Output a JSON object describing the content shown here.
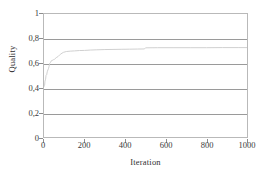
{
  "chart_data": {
    "type": "line",
    "title": "",
    "subtitle": "",
    "xlabel": "Iteration",
    "ylabel": "Quality",
    "xlim": [
      0,
      1000
    ],
    "ylim": [
      0,
      1
    ],
    "grid": "horizontal",
    "legend": "none",
    "decimal_separator": ",",
    "x_ticks": [
      0,
      200,
      400,
      600,
      800,
      1000
    ],
    "y_ticks": [
      0,
      0.2,
      0.4,
      0.6,
      0.8,
      1
    ],
    "x_tick_labels": [
      "0",
      "200",
      "400",
      "600",
      "800",
      "1000"
    ],
    "y_tick_labels": [
      "0",
      "0,2",
      "0,4",
      "0,6",
      "0,8",
      "1"
    ],
    "series": [
      {
        "name": "Quality",
        "color": "#cfcfcf",
        "x": [
          0,
          3,
          5,
          8,
          10,
          13,
          16,
          19,
          22,
          25,
          28,
          32,
          36,
          40,
          46,
          52,
          60,
          70,
          80,
          95,
          110,
          130,
          150,
          175,
          200,
          230,
          260,
          300,
          340,
          380,
          420,
          460,
          495,
          500,
          560,
          640,
          720,
          800,
          880,
          960,
          1000
        ],
        "y": [
          0.41,
          0.42,
          0.455,
          0.47,
          0.5,
          0.505,
          0.53,
          0.545,
          0.555,
          0.575,
          0.6,
          0.605,
          0.62,
          0.622,
          0.628,
          0.632,
          0.645,
          0.655,
          0.672,
          0.688,
          0.695,
          0.698,
          0.7,
          0.703,
          0.704,
          0.707,
          0.709,
          0.711,
          0.712,
          0.713,
          0.714,
          0.715,
          0.716,
          0.725,
          0.726,
          0.726,
          0.726,
          0.726,
          0.727,
          0.727,
          0.727
        ]
      }
    ],
    "annotations": []
  },
  "axes": {
    "border_color": "#b9b9b9",
    "gridline_color": "#9a9a9a",
    "tick_color": "#8d8d8d",
    "text_color": "#3a3a3a"
  },
  "background": "#ffffff"
}
